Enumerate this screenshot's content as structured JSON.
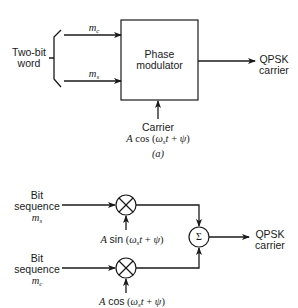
{
  "figure_a": {
    "input_label": "Two-bit word",
    "input_label_line1": "Two-bit",
    "input_label_line2": "word",
    "signal_top": {
      "symbol": "m",
      "subscript": "c"
    },
    "signal_bottom": {
      "symbol": "m",
      "subscript": "s"
    },
    "block_label_line1": "Phase",
    "block_label_line2": "modulator",
    "output_line1": "QPSK",
    "output_line2": "carrier",
    "carrier_label": "Carrier",
    "carrier_expr": "A cos (ω",
    "carrier_expr_sub": "s",
    "carrier_expr_tail": "t + ψ)",
    "caption": "(a)"
  },
  "figure_b": {
    "top_input_line1": "Bit",
    "top_input_line2": "sequence",
    "top_signal": {
      "symbol": "m",
      "subscript": "s"
    },
    "bottom_input_line1": "Bit",
    "bottom_input_line2": "sequence",
    "bottom_signal": {
      "symbol": "m",
      "subscript": "c"
    },
    "top_carrier_prefix": "A",
    "top_carrier_fn": "sin",
    "top_carrier_arg": "(ω",
    "top_carrier_sub": "s",
    "top_carrier_tail": "t + ψ)",
    "bottom_carrier_prefix": "A",
    "bottom_carrier_fn": "cos",
    "bottom_carrier_arg": "(ω",
    "bottom_carrier_sub": "s",
    "bottom_carrier_tail": "t + ψ)",
    "summer_symbol": "Σ",
    "output_line1": "QPSK",
    "output_line2": "carrier"
  }
}
